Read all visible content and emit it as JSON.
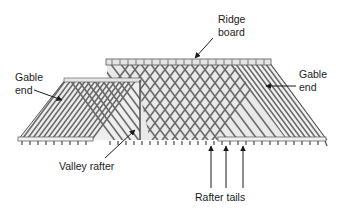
{
  "diagram": {
    "colors": {
      "background": "#ffffff",
      "lumber_stroke": "#6e6e6e",
      "lumber_fill": "#d4d4d4",
      "dark_line": "#3a3a3a",
      "text": "#1a1a1a"
    },
    "labels": {
      "ridge_board": {
        "line1": "Ridge",
        "line2": "board"
      },
      "gable_end_left": {
        "line1": "Gable",
        "line2": "end"
      },
      "gable_end_right": {
        "line1": "Gable",
        "line2": "end"
      },
      "valley_rafter": {
        "text": "Valley rafter"
      },
      "rafter_tails": {
        "text": "Rafter tails"
      }
    }
  }
}
